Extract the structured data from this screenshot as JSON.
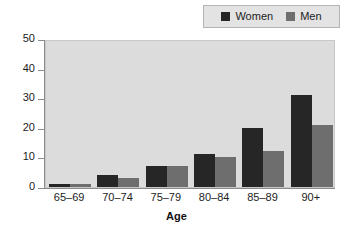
{
  "chart_data": {
    "type": "bar",
    "title": "",
    "xlabel": "Age",
    "ylabel": "Per 100",
    "categories": [
      "65–69",
      "70–74",
      "75–79",
      "80–84",
      "85–89",
      "90+"
    ],
    "series": [
      {
        "name": "Women",
        "color": "#262626",
        "values": [
          1,
          4,
          7,
          11,
          20,
          31
        ]
      },
      {
        "name": "Men",
        "color": "#6e6e6e",
        "values": [
          1,
          3,
          7,
          10,
          12,
          21
        ]
      }
    ],
    "ylim": [
      0,
      50
    ],
    "yticks": [
      0,
      10,
      20,
      30,
      40,
      50
    ],
    "ytick_labels": [
      "0",
      "10",
      "20",
      "30",
      "40",
      "50"
    ],
    "grid": false,
    "legend_position": "top-right",
    "plot_background": "#dcdcdc",
    "figure_background": "#ffffff"
  },
  "legend": {
    "entries": [
      {
        "label": "Women",
        "color": "#262626"
      },
      {
        "label": "Men",
        "color": "#6e6e6e"
      }
    ]
  },
  "axes": {
    "y_title": "Per 100",
    "x_title": "Age"
  }
}
